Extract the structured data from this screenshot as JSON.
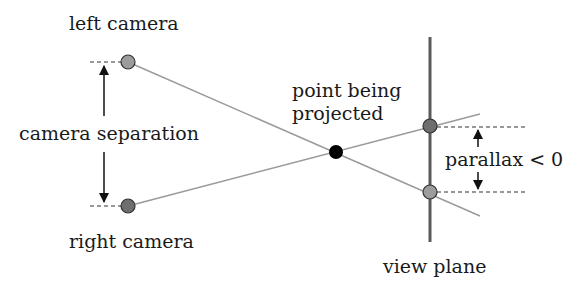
{
  "diagram": {
    "labels": {
      "left_camera": "left camera",
      "right_camera": "right camera",
      "camera_separation": "camera separation",
      "point_line1": "point being",
      "point_line2": "projected",
      "parallax": "parallax < 0",
      "view_plane": "view plane"
    },
    "colors": {
      "ray": "#9a9a9a",
      "plane": "#5a5a5a",
      "left_camera": "#9c9c9c",
      "right_camera": "#6e6e6e",
      "projected_point": "#000000",
      "dashes": "#333333",
      "arrows": "#111111"
    }
  }
}
